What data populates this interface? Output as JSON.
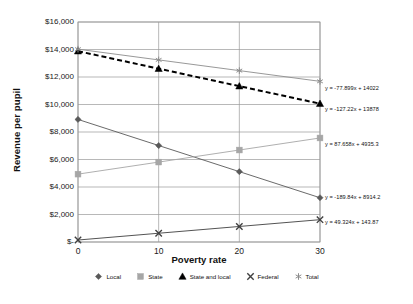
{
  "chart_data": {
    "type": "line",
    "title": "",
    "xlabel": "Poverty rate",
    "ylabel": "Revenue per pupil",
    "x": [
      0,
      10,
      20,
      30
    ],
    "xticklabels": [
      "0",
      "10",
      "20",
      "30"
    ],
    "xlim": [
      0,
      30
    ],
    "ylim": [
      0,
      16000
    ],
    "yticklabels": [
      "$16,000",
      "$14,000",
      "$12,000",
      "$10,000",
      "$8,000",
      "$6,000",
      "$4,000",
      "$2,000",
      "$-"
    ],
    "ytickvalues": [
      16000,
      14000,
      12000,
      10000,
      8000,
      6000,
      4000,
      2000,
      0
    ],
    "grid": "horizontal-and-vertical",
    "legend_position": "bottom",
    "series": [
      {
        "name": "Local",
        "marker": "diamond",
        "linestyle": "solid",
        "color": "#595959",
        "values": [
          8914.2,
          7015.8,
          5117.4,
          3219.0
        ],
        "equation": "y = -189.84x + 8914.2"
      },
      {
        "name": "State",
        "marker": "square",
        "linestyle": "solid",
        "color": "#a6a6a6",
        "values": [
          4935.3,
          5811.9,
          6688.5,
          7565.1
        ],
        "equation": "y = 87.658x + 4935.3"
      },
      {
        "name": "State and local",
        "marker": "triangle",
        "linestyle": "dashed",
        "color": "#000000",
        "values": [
          13878.0,
          12605.8,
          11333.6,
          10061.4
        ],
        "equation": "y = -127.22x + 13878"
      },
      {
        "name": "Federal",
        "marker": "x",
        "linestyle": "solid",
        "color": "#404040",
        "values": [
          143.87,
          637.11,
          1130.35,
          1623.59
        ],
        "equation": "y = 49.324x + 143.87"
      },
      {
        "name": "Total",
        "marker": "asterisk",
        "linestyle": "solid",
        "color": "#8c8c8c",
        "values": [
          14022.0,
          13243.0,
          12464.0,
          11685.0
        ],
        "equation": "y = -77.899x + 14022"
      }
    ],
    "annotations": [
      {
        "text": "y = -77.899x + 14022",
        "series": "Total"
      },
      {
        "text": "y = -127.22x + 13878",
        "series": "State and local"
      },
      {
        "text": "y = 87.658x + 4935.3",
        "series": "State"
      },
      {
        "text": "y = -189.84x + 8914.2",
        "series": "Local"
      },
      {
        "text": "y = 49.324x + 143.87",
        "series": "Federal"
      }
    ]
  },
  "legend": {
    "items": [
      {
        "label": "Local"
      },
      {
        "label": "State"
      },
      {
        "label": "State and local"
      },
      {
        "label": "Federal"
      },
      {
        "label": "Total"
      }
    ]
  }
}
